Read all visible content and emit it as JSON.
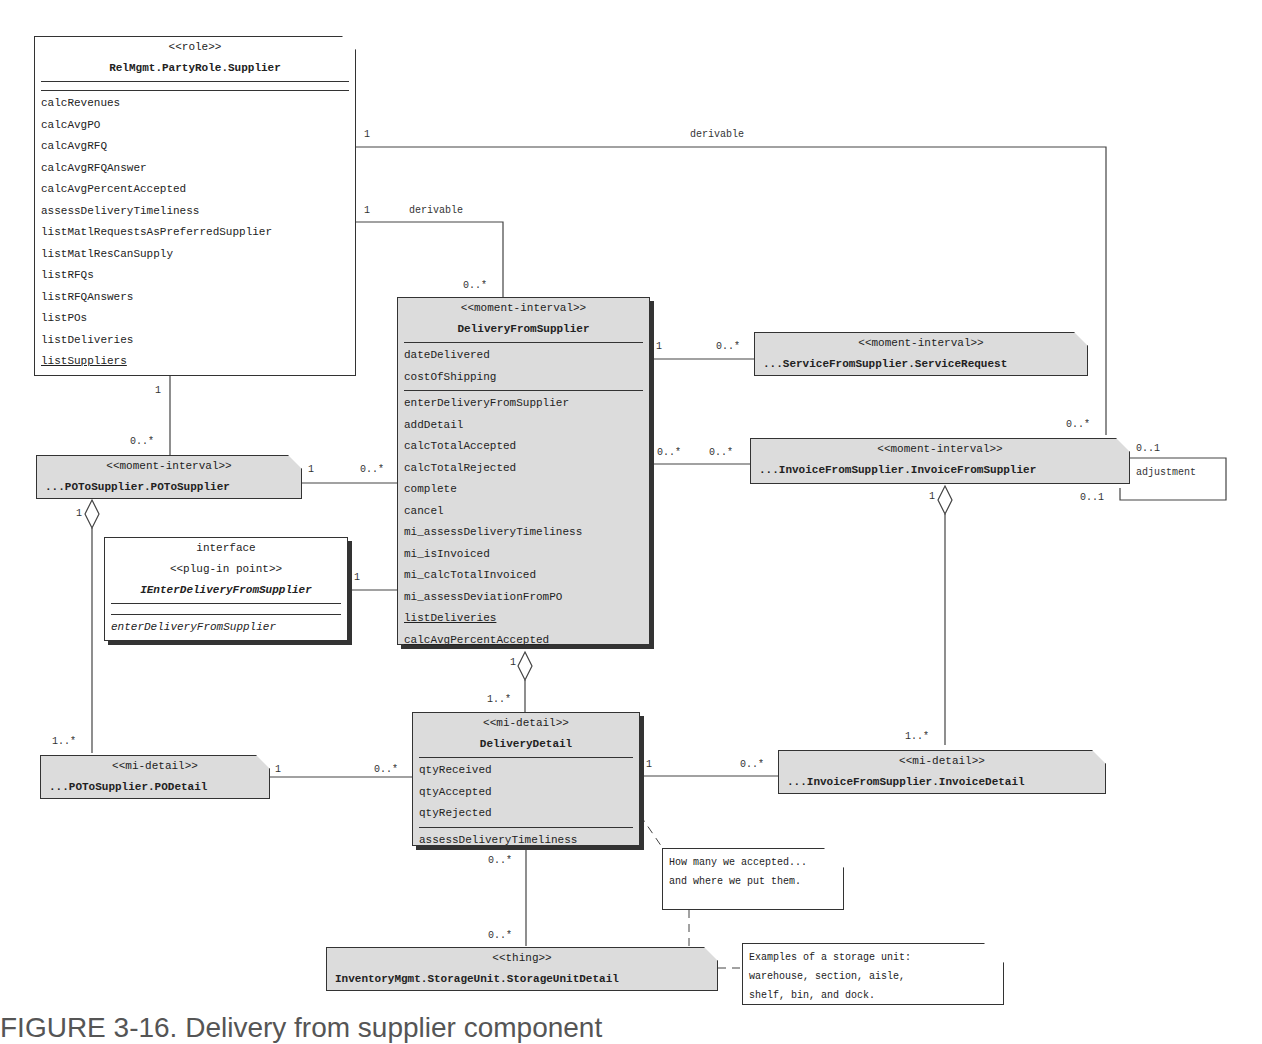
{
  "classes": {
    "supplier": {
      "stereotype": "<<role>>",
      "name": "RelMgmt.PartyRole.Supplier",
      "attributes": [],
      "methods": [
        "calcRevenues",
        "calcAvgPO",
        "calcAvgRFQ",
        "calcAvgRFQAnswer",
        "calcAvgPercentAccepted",
        "assessDeliveryTimeliness",
        "listMatlRequestsAsPreferredSupplier",
        "listMatlResCanSupply",
        "listRFQs",
        "listRFQAnswers",
        "listPOs",
        "listDeliveries"
      ],
      "class_methods": [
        "listSuppliers"
      ]
    },
    "delivery": {
      "stereotype": "<<moment-interval>>",
      "name": "DeliveryFromSupplier",
      "attributes": [
        "dateDelivered",
        "costOfShipping"
      ],
      "methods": [
        "enterDeliveryFromSupplier",
        "addDetail",
        "calcTotalAccepted",
        "calcTotalRejected",
        "complete",
        "cancel",
        "mi_assessDeliveryTimeliness",
        "mi_isInvoiced",
        "mi_calcTotalInvoiced",
        "mi_assessDeviationFromPO"
      ],
      "class_methods": [
        "listDeliveries",
        "calcAvgPercentAccepted"
      ]
    },
    "service_request": {
      "stereotype": "<<moment-interval>>",
      "name": "...ServiceFromSupplier.ServiceRequest"
    },
    "invoice": {
      "stereotype": "<<moment-interval>>",
      "name": "...InvoiceFromSupplier.InvoiceFromSupplier"
    },
    "po": {
      "stereotype": "<<moment-interval>>",
      "name": "...POToSupplier.POToSupplier"
    },
    "interface": {
      "kind": "interface",
      "stereotype": "<<plug-in point>>",
      "name": "IEnterDeliveryFromSupplier",
      "methods": [
        "enterDeliveryFromSupplier"
      ]
    },
    "po_detail": {
      "stereotype": "<<mi-detail>>",
      "name": "...POToSupplier.PODetail"
    },
    "delivery_detail": {
      "stereotype": "<<mi-detail>>",
      "name": "DeliveryDetail",
      "attributes": [
        "qtyReceived",
        "qtyAccepted",
        "qtyRejected"
      ],
      "methods": [
        "assessDeliveryTimeliness"
      ]
    },
    "invoice_detail": {
      "stereotype": "<<mi-detail>>",
      "name": "...InvoiceFromSupplier.InvoiceDetail"
    },
    "storage": {
      "stereotype": "<<thing>>",
      "name": "InventoryMgmt.StorageUnit.StorageUnitDetail"
    }
  },
  "associations": {
    "supplier_invoice": {
      "label": "derivable",
      "from_mult": "1",
      "to_mult": "0..*"
    },
    "supplier_delivery": {
      "label": "derivable",
      "from_mult": "1",
      "to_mult": "0..*"
    },
    "supplier_po": {
      "from_mult": "1",
      "to_mult": "0..*"
    },
    "delivery_service": {
      "from_mult": "1",
      "to_mult": "0..*"
    },
    "delivery_invoice": {
      "from_mult": "0..*",
      "to_mult": "0..*"
    },
    "invoice_adjustment": {
      "label": "adjustment",
      "mult_a": "0..1",
      "mult_b": "0..1"
    },
    "po_delivery": {
      "from_mult": "1",
      "to_mult": "0..*"
    },
    "interface_delivery": {
      "from_mult": "1"
    },
    "po_podetail": {
      "from_mult": "1",
      "to_mult": "1..*"
    },
    "delivery_detail": {
      "from_mult": "1",
      "to_mult": "1..*"
    },
    "invoice_invdetail": {
      "from_mult": "1",
      "to_mult": "1..*"
    },
    "podetail_detail": {
      "from_mult": "1",
      "to_mult": "0..*"
    },
    "detail_invdetail": {
      "from_mult": "1",
      "to_mult": "0..*"
    },
    "detail_storage": {
      "from_mult": "0..*",
      "to_mult": "0..*"
    }
  },
  "notes": {
    "accepted": [
      "How many we accepted...",
      "and where we put them."
    ],
    "storage": [
      "Examples of a storage unit:",
      "warehouse, section, aisle,",
      "shelf, bin, and dock."
    ]
  },
  "caption": "FIGURE 3-16.   Delivery from supplier component"
}
